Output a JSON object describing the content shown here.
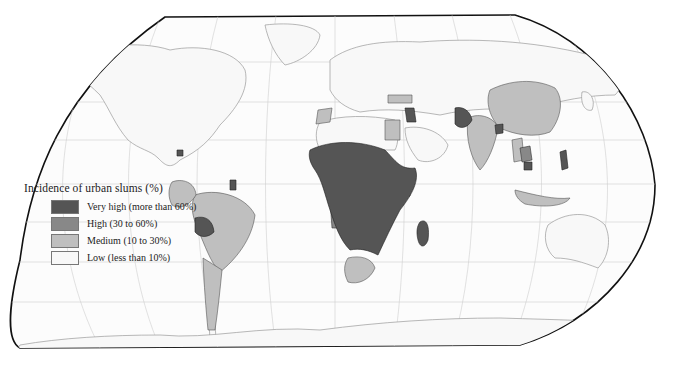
{
  "map": {
    "title": "Incidence of urban slums (%)",
    "projection": "Robinson (world)",
    "colors": {
      "very_high": "#555555",
      "high": "#888888",
      "medium": "#bfbfbf",
      "low": "#f8f8f8",
      "land_default": "#f8f8f8",
      "ocean": "#fcfcfc",
      "border": "#222222",
      "coast": "#999999",
      "graticule": "#c8c8c8"
    },
    "legend": {
      "title": "Incidence of urban slums (%)",
      "items": [
        {
          "key": "very_high",
          "label": "Very high (more than 60%)",
          "color": "#555555"
        },
        {
          "key": "high",
          "label": "High (30 to 60%)",
          "color": "#888888"
        },
        {
          "key": "medium",
          "label": "Medium (10 to 30%)",
          "color": "#bfbfbf"
        },
        {
          "key": "low",
          "label": "Low (less than 10%)",
          "color": "#f8f8f8"
        }
      ]
    },
    "regions": {
      "very_high": [
        "Sub-Saharan Africa (central/east/west)",
        "Madagascar",
        "Pakistan",
        "Bangladesh",
        "Bolivia",
        "Guyana",
        "Guatemala",
        "Haiti",
        "Yemen",
        "Iraq",
        "Cambodia",
        "Philippines"
      ],
      "high": [
        "Nigeria",
        "Angola",
        "Zambia",
        "Kenya",
        "Cameroon",
        "Nepal",
        "Vietnam",
        "Lesotho"
      ],
      "medium": [
        "China",
        "India",
        "Brazil",
        "Argentina",
        "Colombia",
        "Peru",
        "Egypt",
        "Morocco",
        "Turkey",
        "South Africa",
        "Indonesia",
        "Thailand",
        "Mozambique"
      ],
      "low": [
        "North America",
        "Europe",
        "Russia",
        "Australia",
        "Chile",
        "Central Asia"
      ]
    }
  }
}
